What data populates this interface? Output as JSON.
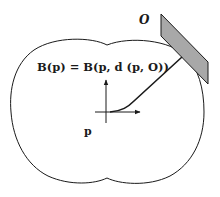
{
  "figure": {
    "formula": {
      "lhs": "B(p)",
      "equals": "=",
      "rhs": "B(p, d (p, O))"
    },
    "labels": {
      "obstacle": "O",
      "point": "p"
    },
    "shapes": {
      "region_outline": "closed lobed boundary B(p)",
      "obstacle": "gray parallelogram",
      "distance_path": "curve from point p to obstacle O",
      "axes": "local coordinate axes at p"
    },
    "colors": {
      "stroke": "#1a1a1a",
      "obstacle_fill": "#a8a8a8",
      "background": "#ffffff"
    }
  }
}
